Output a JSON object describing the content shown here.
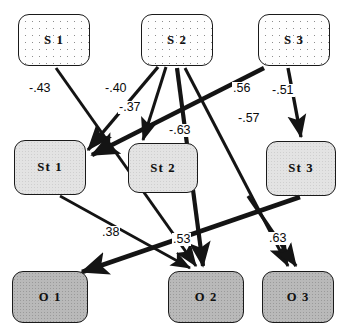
{
  "diagram": {
    "type": "path-diagram",
    "canvas": {
      "width": 343,
      "height": 333
    },
    "rows": [
      {
        "name": "source-row",
        "style": "dotted-fill"
      },
      {
        "name": "mediator-row",
        "style": "light-gray-fill"
      },
      {
        "name": "outcome-row",
        "style": "dark-gray-fill"
      }
    ],
    "nodes": [
      {
        "id": "S1",
        "label": "S 1",
        "row": "source-row",
        "x": 18,
        "y": 14,
        "w": 72,
        "h": 52,
        "fill": "#fefefe"
      },
      {
        "id": "S2",
        "label": "S 2",
        "row": "source-row",
        "x": 141,
        "y": 14,
        "w": 72,
        "h": 52,
        "fill": "#fefefe"
      },
      {
        "id": "S3",
        "label": "S 3",
        "row": "source-row",
        "x": 258,
        "y": 14,
        "w": 72,
        "h": 52,
        "fill": "#fefefe"
      },
      {
        "id": "St1",
        "label": "St 1",
        "row": "mediator-row",
        "x": 14,
        "y": 140,
        "w": 72,
        "h": 55,
        "fill": "#e3e3e3"
      },
      {
        "id": "St2",
        "label": "St 2",
        "row": "mediator-row",
        "x": 128,
        "y": 143,
        "w": 70,
        "h": 50,
        "fill": "#e3e3e3"
      },
      {
        "id": "St3",
        "label": "St 3",
        "row": "mediator-row",
        "x": 266,
        "y": 141,
        "w": 70,
        "h": 55,
        "fill": "#e3e3e3"
      },
      {
        "id": "O1",
        "label": "O 1",
        "row": "outcome-row",
        "x": 12,
        "y": 271,
        "w": 76,
        "h": 52,
        "fill": "#b9b9b9"
      },
      {
        "id": "O2",
        "label": "O 2",
        "row": "outcome-row",
        "x": 168,
        "y": 271,
        "w": 76,
        "h": 52,
        "fill": "#b9b9b9"
      },
      {
        "id": "O3",
        "label": "O 3",
        "row": "outcome-row",
        "x": 262,
        "y": 271,
        "w": 72,
        "h": 52,
        "fill": "#b9b9b9"
      }
    ],
    "edges": [
      {
        "id": "e1",
        "from": "S1",
        "to": "O2",
        "coefficient": "-.43",
        "sign": "negative",
        "label_x": 28,
        "label_y": 82,
        "weight": 3.0
      },
      {
        "id": "e2",
        "from": "S2",
        "to": "St1",
        "coefficient": "-.40",
        "sign": "negative",
        "label_x": 104,
        "label_y": 82,
        "weight": 3.4
      },
      {
        "id": "e3",
        "from": "S2",
        "to": "St2",
        "coefficient": "-.37",
        "sign": "negative",
        "label_x": 118,
        "label_y": 101,
        "weight": 3.0
      },
      {
        "id": "e4",
        "from": "S2",
        "to": "O2",
        "coefficient": "-.63",
        "sign": "negative",
        "label_x": 168,
        "label_y": 124,
        "weight": 4.2
      },
      {
        "id": "e5",
        "from": "S2",
        "to": "O3",
        "coefficient": "-.57",
        "sign": "negative",
        "label_x": 237,
        "label_y": 112,
        "weight": 3.0
      },
      {
        "id": "e6",
        "from": "S3",
        "to": "St1",
        "coefficient": ".56",
        "sign": "positive",
        "label_x": 232,
        "label_y": 82,
        "weight": 4.6
      },
      {
        "id": "e7",
        "from": "S3",
        "to": "St3",
        "coefficient": "-.51",
        "sign": "negative",
        "label_x": 271,
        "label_y": 84,
        "weight": 3.4
      },
      {
        "id": "e8",
        "from": "St1",
        "to": "O2",
        "coefficient": ".38",
        "sign": "positive",
        "label_x": 101,
        "label_y": 226,
        "weight": 2.6
      },
      {
        "id": "e9",
        "from": "St3",
        "to": "O1",
        "coefficient": ".53",
        "sign": "positive",
        "label_x": 172,
        "label_y": 233,
        "weight": 4.6
      },
      {
        "id": "e10",
        "from": "S3",
        "to": "O3",
        "coefficient": ".63",
        "sign": "positive",
        "label_x": 268,
        "label_y": 232,
        "weight": 3.4
      }
    ]
  }
}
